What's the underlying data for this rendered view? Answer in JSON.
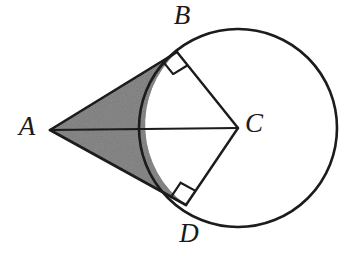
{
  "figure": {
    "type": "geometry-diagram",
    "width": 354,
    "height": 256,
    "background_color": "#ffffff",
    "stroke_color": "#1a1a1a",
    "shaded_fill_color": "#6f6f6f"
  },
  "labels": {
    "a": "A",
    "b": "B",
    "c": "C",
    "d": "D"
  },
  "label_positions": {
    "a": {
      "x": 27,
      "y": 129
    },
    "b": {
      "x": 182,
      "y": 18
    },
    "c": {
      "x": 254,
      "y": 126
    },
    "d": {
      "x": 189,
      "y": 236
    }
  },
  "geometry": {
    "circle": {
      "cx": 238,
      "cy": 128,
      "r": 99,
      "stroke_width": 2.6
    },
    "points": {
      "A": {
        "x": 50,
        "y": 130,
        "role": "external-apex"
      },
      "B": {
        "x": 177,
        "y": 52,
        "role": "upper-tangent-point"
      },
      "C": {
        "x": 238,
        "y": 128,
        "role": "circle-center"
      },
      "D": {
        "x": 186,
        "y": 205,
        "role": "lower-tangent-point"
      }
    },
    "segments": [
      {
        "name": "tangent-AB",
        "from": "A",
        "to": "B"
      },
      {
        "name": "tangent-AD",
        "from": "A",
        "to": "D"
      },
      {
        "name": "radius-CB",
        "from": "C",
        "to": "B"
      },
      {
        "name": "radius-CD",
        "from": "C",
        "to": "D"
      },
      {
        "name": "axis-AC",
        "from": "A",
        "to": "C"
      }
    ],
    "right_angle_markers": [
      {
        "name": "right-angle-at-B",
        "vertex": "B",
        "size": 17
      },
      {
        "name": "right-angle-at-D",
        "vertex": "D",
        "size": 17
      }
    ],
    "shaded_region": {
      "name": "kite-minus-sector",
      "description": "Region bounded by tangents AB and AD and the minor arc BD nearest A",
      "fill": "#6f6f6f"
    },
    "shaded_path": "M 50 130 L 177 52 A 99 99 0 0 0 186 205 Z"
  }
}
